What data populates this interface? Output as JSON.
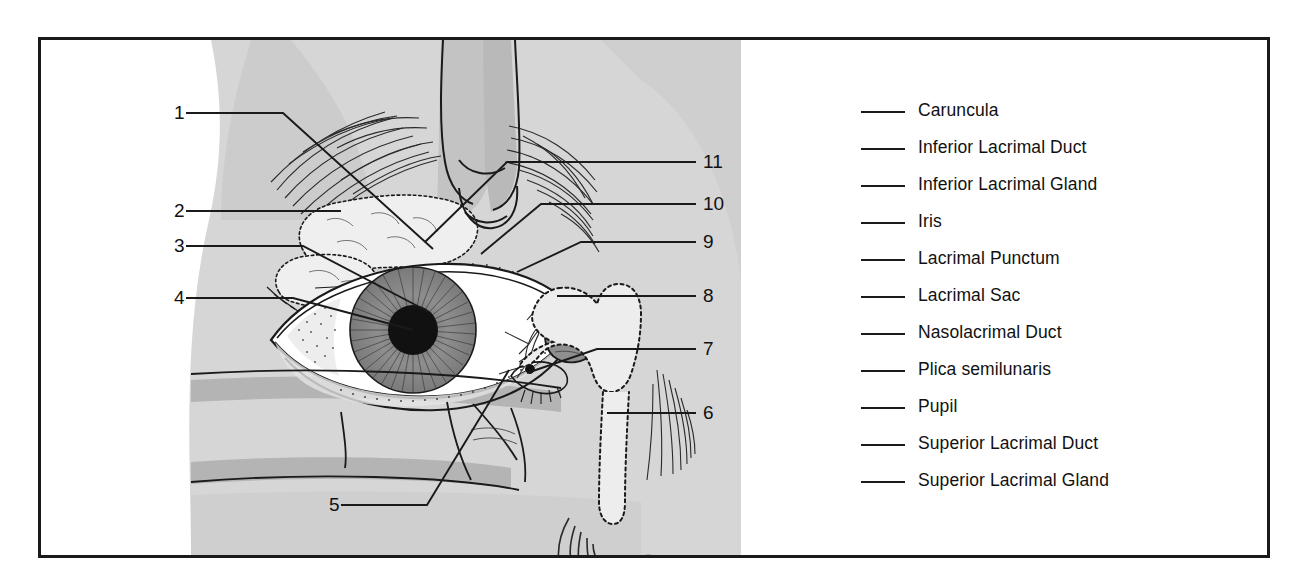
{
  "figure": {
    "kind": "anatomy-worksheet",
    "frame_color": "#1a1a1a",
    "background_color": "#ffffff",
    "art_tones": {
      "skin_light": "#d6d6d6",
      "skin_mid": "#c2c2c2",
      "skin_dark": "#b0b0b0",
      "ink": "#1a1a1a",
      "sclera": "#ffffff",
      "iris": "#8c8c8c",
      "pupil": "#111111",
      "caruncle": "#8f8f8f"
    }
  },
  "callouts": [
    {
      "id": "1",
      "label": "1",
      "x": 171,
      "y": 100,
      "side": "left"
    },
    {
      "id": "2",
      "label": "2",
      "x": 171,
      "y": 198,
      "side": "left"
    },
    {
      "id": "3",
      "label": "3",
      "x": 171,
      "y": 233,
      "side": "left"
    },
    {
      "id": "4",
      "label": "4",
      "x": 171,
      "y": 285,
      "side": "left"
    },
    {
      "id": "5",
      "label": "5",
      "x": 331,
      "y": 492,
      "side": "left"
    },
    {
      "id": "6",
      "label": "6",
      "x": 690,
      "y": 400,
      "side": "right"
    },
    {
      "id": "7",
      "label": "7",
      "x": 690,
      "y": 336,
      "side": "right"
    },
    {
      "id": "8",
      "label": "8",
      "x": 690,
      "y": 283,
      "side": "right"
    },
    {
      "id": "9",
      "label": "9",
      "x": 672,
      "y": 229,
      "side": "right"
    },
    {
      "id": "10",
      "label": "10",
      "x": 663,
      "y": 191,
      "side": "right"
    },
    {
      "id": "11",
      "label": "11",
      "x": 663,
      "y": 149,
      "side": "right"
    }
  ],
  "legend": {
    "items": [
      {
        "text": "Caruncula"
      },
      {
        "text": "Inferior Lacrimal Duct"
      },
      {
        "text": "Inferior Lacrimal Gland"
      },
      {
        "text": "Iris"
      },
      {
        "text": "Lacrimal Punctum"
      },
      {
        "text": "Lacrimal Sac"
      },
      {
        "text": "Nasolacrimal Duct"
      },
      {
        "text": "Plica semilunaris"
      },
      {
        "text": "Pupil"
      },
      {
        "text": "Superior Lacrimal Duct"
      },
      {
        "text": "Superior Lacrimal Gland"
      }
    ]
  }
}
